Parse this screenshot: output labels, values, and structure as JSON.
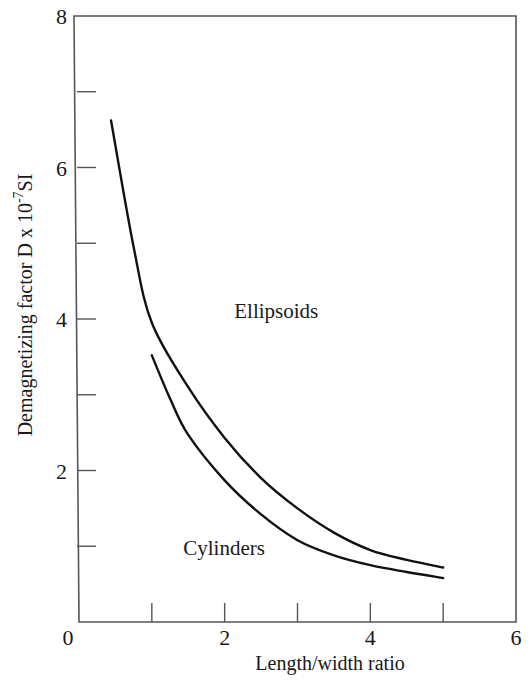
{
  "chart_data": {
    "type": "line",
    "title": "",
    "xlabel": "Length/width ratio",
    "ylabel": "Demagnetizing factor  D x 10",
    "ylabel_superscript": "-7",
    "ylabel_suffix": "SI",
    "xlim": [
      0,
      6
    ],
    "ylim": [
      0,
      8
    ],
    "x_ticks_major": [
      0,
      2,
      4,
      6
    ],
    "x_ticks_minor": [
      1,
      3,
      5
    ],
    "y_ticks_major": [
      0,
      2,
      4,
      6,
      8
    ],
    "y_ticks_minor": [
      1,
      3,
      5,
      7
    ],
    "grid": false,
    "legend": "inline labels",
    "series": [
      {
        "name": "Ellipsoids",
        "x": [
          0.44,
          0.75,
          1.0,
          1.5,
          2.0,
          2.5,
          3.0,
          3.5,
          4.0,
          4.5,
          5.0
        ],
        "y": [
          6.62,
          4.95,
          3.95,
          3.1,
          2.43,
          1.9,
          1.5,
          1.18,
          0.95,
          0.82,
          0.72
        ]
      },
      {
        "name": "Cylinders",
        "x": [
          1.0,
          1.25,
          1.5,
          2.0,
          2.5,
          3.0,
          3.5,
          4.0,
          4.5,
          5.0
        ],
        "y": [
          3.52,
          2.95,
          2.47,
          1.87,
          1.42,
          1.08,
          0.88,
          0.75,
          0.66,
          0.58
        ]
      }
    ],
    "annotations": [
      {
        "text": "Ellipsoids",
        "x": 2.2,
        "y": 4.1
      },
      {
        "text": "Cylinders",
        "x": 1.5,
        "y": 0.98
      }
    ]
  },
  "colors": {
    "line": "#111111",
    "axis": "#555555",
    "text": "#1a1a1a",
    "background": "#ffffff"
  }
}
